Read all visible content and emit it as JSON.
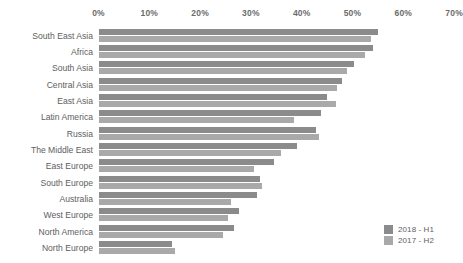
{
  "chart_data": {
    "type": "bar",
    "orientation": "horizontal",
    "title": "",
    "subtitle": "",
    "xlabel": "",
    "ylabel": "",
    "xlim": [
      0,
      70
    ],
    "grid": false,
    "legend_position": "bottom-right",
    "tick_labels": [
      "0%",
      "10%",
      "20%",
      "30%",
      "40%",
      "50%",
      "60%",
      "70%"
    ],
    "tick_values": [
      0,
      10,
      20,
      30,
      40,
      50,
      60,
      70
    ],
    "categories": [
      "South East Asia",
      "Africa",
      "South Asia",
      "Central Asia",
      "East Asia",
      "Latin America",
      "Russia",
      "The Middle East",
      "East Europe",
      "South Europe",
      "Australia",
      "West Europe",
      "North America",
      "North Europe"
    ],
    "series": [
      {
        "name": "2018 - H1",
        "color": "#8b8b8b",
        "values": [
          55.0,
          54.1,
          50.3,
          47.9,
          45.0,
          43.8,
          42.9,
          39.0,
          34.5,
          31.8,
          31.2,
          27.7,
          26.7,
          14.4
        ]
      },
      {
        "name": "2017 - H2",
        "color": "#a9a9a9",
        "values": [
          53.6,
          52.5,
          48.9,
          46.9,
          46.7,
          38.4,
          43.4,
          35.9,
          30.7,
          32.2,
          26.0,
          25.5,
          24.5,
          15.0
        ]
      }
    ]
  },
  "legend": {
    "items": [
      {
        "label": "2018 - H1",
        "color": "#8b8b8b"
      },
      {
        "label": "2017 - H2",
        "color": "#a9a9a9"
      }
    ]
  }
}
